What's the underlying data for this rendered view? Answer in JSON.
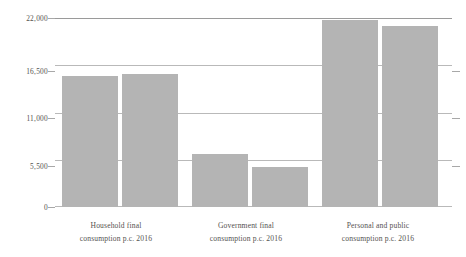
{
  "chart_data": {
    "type": "bar",
    "title": "",
    "subtitle": "",
    "xlabel": "",
    "ylabel": "",
    "ylim": [
      0,
      22000
    ],
    "yticks": [
      0,
      5500,
      11000,
      16500,
      22000
    ],
    "ytick_labels": [
      "0",
      "5,500",
      "11,000",
      "16,500",
      "22,000"
    ],
    "grid": true,
    "legend": "none",
    "bar_color": "#b4b4b4",
    "categories": [
      "Household final consumption p.c. 2016",
      "Government final consumption p.c. 2016",
      "Personal and public consumption p.c. 2016"
    ],
    "category_lines": [
      {
        "line1": "Household final",
        "line2": "consumption p.c. 2016"
      },
      {
        "line1": "Government final",
        "line2": "consumption p.c. 2016"
      },
      {
        "line1": "Personal and public",
        "line2": "consumption p.c. 2016"
      }
    ],
    "series": [
      {
        "name": "Series 1",
        "values": [
          15250,
          6170,
          21770
        ]
      },
      {
        "name": "Series 2",
        "values": [
          15480,
          4650,
          21070
        ]
      }
    ],
    "bars": [
      {
        "group": 0,
        "series": 0,
        "value": 15250
      },
      {
        "group": 0,
        "series": 1,
        "value": 15480
      },
      {
        "group": 1,
        "series": 0,
        "value": 6170
      },
      {
        "group": 1,
        "series": 1,
        "value": 4650
      },
      {
        "group": 2,
        "series": 0,
        "value": 21770
      },
      {
        "group": 2,
        "series": 1,
        "value": 21070
      }
    ]
  },
  "axis": {
    "y": {
      "t0": "22,000",
      "t1": "16,500",
      "t2": "11,000",
      "t3": "5,500",
      "t4": "0"
    }
  },
  "categories": {
    "c0l1": "Household final",
    "c0l2": "consumption p.c. 2016",
    "c1l1": "Government final",
    "c1l2": "consumption p.c. 2016",
    "c2l1": "Personal and public",
    "c2l2": "consumption p.c. 2016"
  }
}
